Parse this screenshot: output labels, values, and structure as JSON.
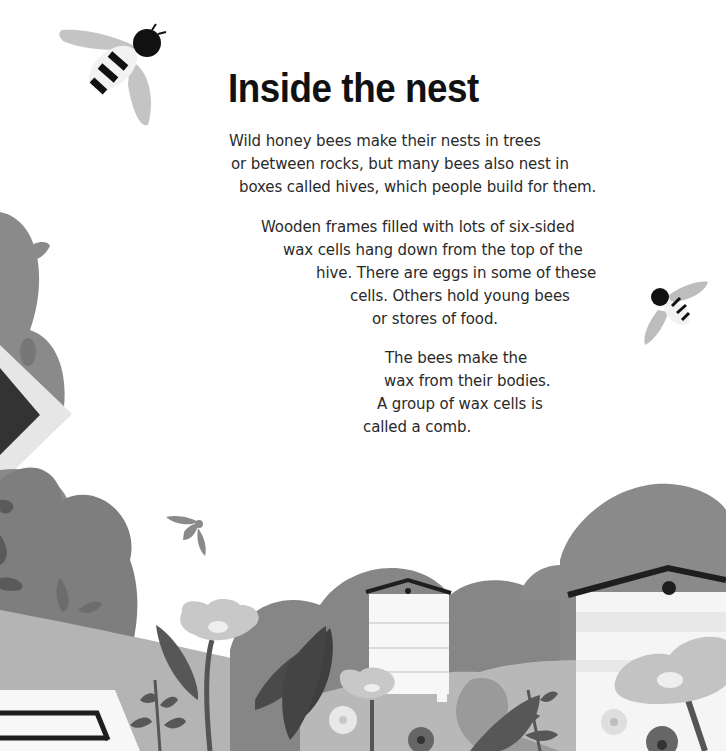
{
  "page": {
    "title": "Inside the nest",
    "paragraphs": [
      {
        "lines": [
          "Wild honey bees make their nests in trees",
          "or between rocks, but many bees also nest in",
          "boxes called hives, which people build for them."
        ]
      },
      {
        "lines": [
          "Wooden frames filled with lots of six-sided",
          "wax cells hang down from the top of the",
          "hive. There are eggs in some of these",
          "cells. Others hold young bees",
          "or stores of food."
        ]
      },
      {
        "lines": [
          "The bees make the",
          "wax from their bodies.",
          "A group of wax cells is",
          "called a comb."
        ]
      }
    ]
  },
  "illustration": {
    "elements": [
      "bee-large-icon",
      "bee-small-icon",
      "bee-silhouette-icon",
      "beehive-left",
      "beehive-center",
      "beehive-right",
      "bushes",
      "flowers",
      "leaves"
    ],
    "colors": {
      "background": "#ffffff",
      "bush_dark": "#7a7a7a",
      "bush_mid": "#8c8c8c",
      "ground_light": "#b4b4b4",
      "leaf_dark": "#555555",
      "flower_light": "#c8c8c8",
      "hive_white": "#f7f7f7",
      "roof_black": "#1e1e1e",
      "wing_gray": "#bdbdbd"
    }
  }
}
